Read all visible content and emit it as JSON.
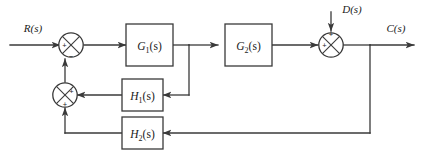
{
  "diagram": {
    "type": "block-diagram",
    "canvas": {
      "width": 424,
      "height": 161
    },
    "colors": {
      "background": "#ffffff",
      "line": "#3a3a3a",
      "text": "#1a1a1a"
    }
  },
  "signals": {
    "input": {
      "label": "R(s)",
      "name": "reference-input"
    },
    "output": {
      "label": "C(s)",
      "name": "controlled-output"
    },
    "disturbance": {
      "label": "D(s)",
      "name": "disturbance-input"
    }
  },
  "blocks": [
    {
      "id": "G1",
      "base": "G",
      "sub": "1",
      "arg": "(s)",
      "label": "G₁(s)",
      "name": "block-g1"
    },
    {
      "id": "G2",
      "base": "G",
      "sub": "2",
      "arg": "(s)",
      "label": "G₂(s)",
      "name": "block-g2"
    },
    {
      "id": "H1",
      "base": "H",
      "sub": "1",
      "arg": "(s)",
      "label": "H₁(s)",
      "name": "block-h1"
    },
    {
      "id": "H2",
      "base": "H",
      "sub": "2",
      "arg": "(s)",
      "label": "H₂(s)",
      "name": "block-h2"
    }
  ],
  "summing_junctions": [
    {
      "id": "sum1",
      "name": "summing-junction-input",
      "signs": {
        "left": "+",
        "bottom": "−"
      }
    },
    {
      "id": "sum2",
      "name": "summing-junction-feedback",
      "signs": {
        "right": "+",
        "bottom": "+"
      }
    },
    {
      "id": "sum3",
      "name": "summing-junction-disturbance",
      "signs": {
        "left": "+",
        "top": "+"
      }
    }
  ],
  "signs": {
    "plus": "+",
    "minus": "−"
  }
}
